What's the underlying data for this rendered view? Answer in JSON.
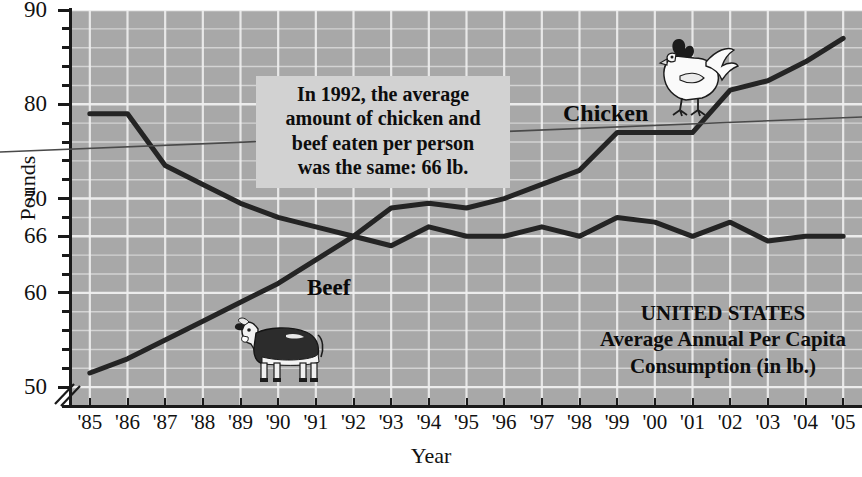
{
  "chart_data": {
    "type": "line",
    "title": "UNITED STATES Average Annual Per Capita Consumption (in lb.)",
    "xlabel": "Year",
    "ylabel": "Pounds",
    "ylim": [
      48,
      90
    ],
    "yticks": [
      50,
      60,
      66,
      70,
      80,
      90
    ],
    "ytick_labels": [
      "50",
      "60",
      "66",
      "70",
      "80",
      "90"
    ],
    "y_minor_step": 2,
    "grid": true,
    "axis_break": true,
    "categories": [
      "'85",
      "'86",
      "'87",
      "'88",
      "'89",
      "'90",
      "'91",
      "'92",
      "'93",
      "'94",
      "'95",
      "'96",
      "'97",
      "'98",
      "'99",
      "'00",
      "'01",
      "'02",
      "'03",
      "'04",
      "'05"
    ],
    "x": [
      1985,
      1986,
      1987,
      1988,
      1989,
      1990,
      1991,
      1992,
      1993,
      1994,
      1995,
      1996,
      1997,
      1998,
      1999,
      2000,
      2001,
      2002,
      2003,
      2004,
      2005
    ],
    "series": [
      {
        "name": "Beef",
        "values": [
          79,
          79,
          73.5,
          71.5,
          69.5,
          68,
          67,
          66,
          65,
          67,
          66,
          66,
          67,
          66,
          68,
          67.5,
          66,
          67.5,
          65.5,
          66,
          66
        ]
      },
      {
        "name": "Chicken",
        "values": [
          51.5,
          53,
          55,
          57,
          59,
          61,
          63.5,
          66,
          69,
          69.5,
          69,
          70,
          71.5,
          73,
          77,
          77,
          77,
          81.5,
          82.5,
          84.5,
          87
        ]
      }
    ],
    "legend_position": "inline-labels",
    "annotations": [
      {
        "id": "callout-1992",
        "lines": [
          "In 1992, the average",
          "amount of chicken and",
          "beef eaten per person",
          "was the same: 66 lb."
        ],
        "points_to": {
          "x": 1992,
          "y": 66
        }
      }
    ]
  },
  "axes": {
    "y_title": "Pounds",
    "x_title": "Year",
    "y_tick_labels": [
      "90",
      "80",
      "70",
      "66",
      "60",
      "50"
    ],
    "x_tick_labels": [
      "'85",
      "'86",
      "'87",
      "'88",
      "'89",
      "'90",
      "'91",
      "'92",
      "'93",
      "'94",
      "'95",
      "'96",
      "'97",
      "'98",
      "'99",
      "'00",
      "'01",
      "'02",
      "'03",
      "'04",
      "'05"
    ]
  },
  "callout": {
    "line1": "In 1992, the average",
    "line2": "amount of chicken and",
    "line3": "beef eaten per person",
    "line4": "was the same: 66 lb."
  },
  "series_labels": {
    "chicken": "Chicken",
    "beef": "Beef"
  },
  "caption": {
    "line1": "UNITED STATES",
    "line2": "Average Annual Per Capita",
    "line3": "Consumption (in lb.)"
  },
  "colors": {
    "plot_background": "#a8a8a8",
    "gridline": "#f0f0f0",
    "series_line": "#242424",
    "axis": "#1a1a1a",
    "callout_background": "#d2d2d2",
    "page_background": "#ffffff"
  },
  "icons": {
    "cow": "cow-illustration",
    "chicken": "chicken-illustration"
  }
}
